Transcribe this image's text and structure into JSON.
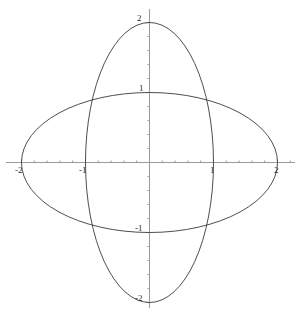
{
  "chart_data": {
    "type": "line",
    "title": "",
    "subtitle": "",
    "xlabel": "",
    "ylabel": "",
    "xlim": [
      -2.34,
      2.34
    ],
    "ylim": [
      -2.32,
      2.32
    ],
    "grid": false,
    "legend": null,
    "axis_style": "crossed-at-origin",
    "x_tick_labels": [
      "-2",
      "-1",
      "1",
      "2"
    ],
    "y_tick_labels": [
      "2",
      "1",
      "-1",
      "-2"
    ],
    "x_ticks_major": [
      -2,
      -1,
      1,
      2
    ],
    "y_ticks_major": [
      2,
      1,
      -1,
      -2
    ],
    "x_ticks_minor": [
      -1.8,
      -1.6,
      -1.4,
      -1.2,
      -0.8,
      -0.6,
      -0.4,
      -0.2,
      0.2,
      0.4,
      0.6,
      0.8,
      1.2,
      1.4,
      1.6,
      1.8,
      2.2
    ],
    "y_ticks_minor": [
      1.8,
      1.6,
      1.4,
      1.2,
      0.8,
      0.6,
      0.4,
      0.2,
      -0.2,
      -0.4,
      -0.6,
      -0.8,
      -1.2,
      -1.4,
      -1.6,
      -1.8,
      -2.2
    ],
    "series": [
      {
        "name": "horizontal-ellipse",
        "equation": "x^2/4 + y^2/1 = 1",
        "semi_axis_x": 2,
        "semi_axis_y": 1,
        "center": [
          0,
          0
        ],
        "color": "#3a3a3a"
      },
      {
        "name": "vertical-ellipse",
        "equation": "x^2/1 + y^2/4 = 1",
        "semi_axis_x": 1,
        "semi_axis_y": 2,
        "center": [
          0,
          0
        ],
        "color": "#3a3a3a"
      }
    ],
    "intersections": [
      [
        0.8944,
        0.8944
      ],
      [
        -0.8944,
        0.8944
      ],
      [
        -0.8944,
        -0.8944
      ],
      [
        0.8944,
        -0.8944
      ]
    ]
  },
  "plot": {
    "background_color": "#ffffff",
    "axis_color": "#9a9a9a",
    "curve_color": "#3a3a3a",
    "label_color": "#2b2b2b",
    "origin_px": [
      149.5,
      162.5
    ],
    "px_per_unit_x": 64,
    "px_per_unit_y": 70,
    "labels": {
      "y_top": "2",
      "y_upper": "1",
      "y_lower": "-1",
      "y_bottom": "-2",
      "x_left_outer": "-2",
      "x_left_inner": "-1",
      "x_right_inner": "1",
      "x_right_outer": "2"
    }
  }
}
